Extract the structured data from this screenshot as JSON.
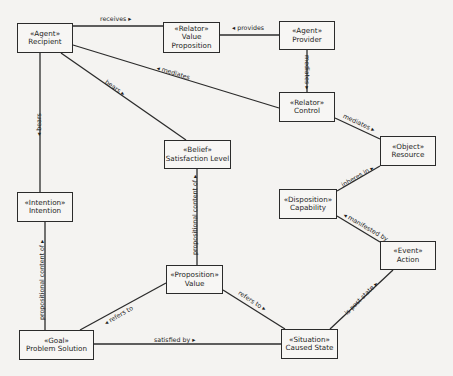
{
  "diagram": {
    "type": "ontology-model",
    "nodes": [
      {
        "id": "recipient",
        "stereotype": "«Agent»",
        "name": "Recipient",
        "x": 17,
        "y": 23,
        "w": 56,
        "h": 30
      },
      {
        "id": "value_proposition",
        "stereotype": "«Relator»",
        "name": "Value Proposition",
        "name_lines": [
          "Value",
          "Proposition"
        ],
        "x": 163,
        "y": 22,
        "w": 57,
        "h": 31
      },
      {
        "id": "provider",
        "stereotype": "«Agent»",
        "name": "Provider",
        "x": 279,
        "y": 21,
        "w": 56,
        "h": 29
      },
      {
        "id": "control",
        "stereotype": "«Relator»",
        "name": "Control",
        "x": 279,
        "y": 92,
        "w": 56,
        "h": 30
      },
      {
        "id": "satisfaction_level",
        "stereotype": "«Belief»",
        "name": "Satisfaction Level",
        "x": 164,
        "y": 140,
        "w": 67,
        "h": 29
      },
      {
        "id": "resource",
        "stereotype": "«Object»",
        "name": "Resource",
        "x": 380,
        "y": 136,
        "w": 56,
        "h": 30
      },
      {
        "id": "intention",
        "stereotype": "«Intention»",
        "name": "Intention",
        "x": 17,
        "y": 192,
        "w": 56,
        "h": 30
      },
      {
        "id": "capability",
        "stereotype": "«Disposition»",
        "name": "Capability",
        "x": 279,
        "y": 189,
        "w": 58,
        "h": 30
      },
      {
        "id": "action",
        "stereotype": "«Event»",
        "name": "Action",
        "x": 380,
        "y": 241,
        "w": 56,
        "h": 29
      },
      {
        "id": "value",
        "stereotype": "«Proposition»",
        "name": "Value",
        "x": 166,
        "y": 265,
        "w": 57,
        "h": 29
      },
      {
        "id": "problem_solution",
        "stereotype": "«Goal»",
        "name": "Problem Solution",
        "x": 19,
        "y": 330,
        "w": 75,
        "h": 30
      },
      {
        "id": "caused_state",
        "stereotype": "«Situation»",
        "name": "Caused State",
        "x": 281,
        "y": 329,
        "w": 57,
        "h": 30
      }
    ],
    "edges": [
      {
        "from": "recipient",
        "to": "value_proposition",
        "label": "receives ▸",
        "x1": 73,
        "y1": 26,
        "x2": 163,
        "y2": 26
      },
      {
        "from": "provider",
        "to": "value_proposition",
        "label": "◂ provides",
        "x1": 220,
        "y1": 35,
        "x2": 279,
        "y2": 35
      },
      {
        "from": "provider",
        "to": "control",
        "label": "mediates ▸",
        "x1": 307,
        "y1": 50,
        "x2": 307,
        "y2": 92
      },
      {
        "from": "control",
        "to": "recipient",
        "label": "◂ mediates",
        "x1": 73,
        "y1": 45,
        "x2": 279,
        "y2": 108
      },
      {
        "from": "recipient",
        "to": "satisfaction_level",
        "label": "bears ▸",
        "x1": 61,
        "y1": 53,
        "x2": 186,
        "y2": 140
      },
      {
        "from": "recipient",
        "to": "intention",
        "label": "◂ bears",
        "x1": 40,
        "y1": 53,
        "x2": 40,
        "y2": 192
      },
      {
        "from": "control",
        "to": "resource",
        "label": "mediates ▸",
        "x1": 335,
        "y1": 118,
        "x2": 380,
        "y2": 139
      },
      {
        "from": "capability",
        "to": "resource",
        "label": "inheres in ▸",
        "x1": 337,
        "y1": 191,
        "x2": 380,
        "y2": 166
      },
      {
        "from": "action",
        "to": "capability",
        "label": "◂ manifested by",
        "x1": 337,
        "y1": 216,
        "x2": 380,
        "y2": 242
      },
      {
        "from": "value",
        "to": "satisfaction_level",
        "label": "propositional content of ▸",
        "x1": 197,
        "y1": 169,
        "x2": 197,
        "y2": 265
      },
      {
        "from": "problem_solution",
        "to": "intention",
        "label": "propositional content of ▸",
        "x1": 45,
        "y1": 222,
        "x2": 45,
        "y2": 330
      },
      {
        "from": "problem_solution",
        "to": "value",
        "label": "◂ refers to",
        "x1": 80,
        "y1": 330,
        "x2": 166,
        "y2": 283
      },
      {
        "from": "value",
        "to": "caused_state",
        "label": "refers to ▸",
        "x1": 223,
        "y1": 290,
        "x2": 285,
        "y2": 329
      },
      {
        "from": "problem_solution",
        "to": "caused_state",
        "label": "satisfied by ▸",
        "x1": 94,
        "y1": 344,
        "x2": 281,
        "y2": 344
      },
      {
        "from": "caused_state",
        "to": "action",
        "label": "is post state ▸",
        "x1": 330,
        "y1": 329,
        "x2": 393,
        "y2": 270
      }
    ],
    "labels": [
      {
        "text": "receives ▸",
        "x": 100,
        "y": 15,
        "rot": 0
      },
      {
        "text": "◂ provides",
        "x": 232,
        "y": 24,
        "rot": 0
      },
      {
        "text": "mediates ▸",
        "x": 311,
        "y": 55,
        "rot": 90
      },
      {
        "text": "◂ mediates",
        "x": 158,
        "y": 64,
        "rot": 17
      },
      {
        "text": "bears ▸",
        "x": 108,
        "y": 78,
        "rot": 35
      },
      {
        "text": "◂ bears",
        "x": 35,
        "y": 136,
        "rot": -90
      },
      {
        "text": "mediates ▸",
        "x": 345,
        "y": 112,
        "rot": 25
      },
      {
        "text": "inheres in ▸",
        "x": 340,
        "y": 182,
        "rot": -30
      },
      {
        "text": "◂ manifested by",
        "x": 346,
        "y": 211,
        "rot": 30
      },
      {
        "text": "propositional content of ▸",
        "x": 191,
        "y": 255,
        "rot": -90
      },
      {
        "text": "propositional content of ▸",
        "x": 38,
        "y": 320,
        "rot": -90
      },
      {
        "text": "◂ refers to",
        "x": 103,
        "y": 320,
        "rot": -30
      },
      {
        "text": "refers to ▸",
        "x": 241,
        "y": 289,
        "rot": 33
      },
      {
        "text": "satisfied by ▸",
        "x": 154,
        "y": 336,
        "rot": 0
      },
      {
        "text": "is post state ▸",
        "x": 343,
        "y": 311,
        "rot": -45
      }
    ],
    "colors": {
      "line": "#2b2b2b",
      "background": "#f4f3f1",
      "box": "#f7f6f4"
    }
  }
}
